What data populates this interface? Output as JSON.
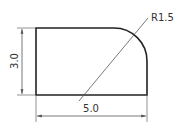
{
  "drawing": {
    "type": "engineering-dimension-drawing",
    "shape": "rectangle-with-rounded-corner",
    "dimensions": {
      "width_label": "5.0",
      "height_label": "3.0",
      "radius_label": "R1.5"
    },
    "colors": {
      "outline": "#222222",
      "dimension_line": "#555555",
      "text": "#333333",
      "background": "#ffffff"
    }
  }
}
